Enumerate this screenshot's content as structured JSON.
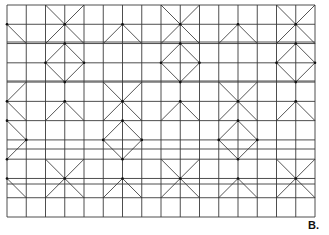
{
  "figure": {
    "panel_label": "B.",
    "grid": {
      "x0": 7,
      "x1": 315,
      "cols": 16,
      "y0": 5,
      "y1": 217,
      "rows": 11,
      "extra_rows_y": [
        42,
        81,
        149,
        184
      ],
      "line_color": "#3a3a3a"
    },
    "motif": {
      "description": "Repeating pattern of X crosses and diamonds drawn over a square grid",
      "x_centers": [
        3,
        9,
        15
      ],
      "x_shift_centers": [
        0,
        6,
        12
      ],
      "row_period": 4,
      "x_rows": [
        1,
        5,
        9
      ],
      "diamond_rows": [
        3,
        7
      ],
      "arm": 2,
      "diag_color": "#2a2a2a"
    }
  }
}
